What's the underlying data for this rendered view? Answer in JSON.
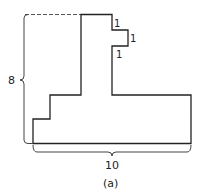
{
  "figure": {
    "caption": "(a)",
    "colors": {
      "stroke": "#222222",
      "background": "#ffffff",
      "dashed": "#555555"
    },
    "dimensions": {
      "height_label": "8",
      "width_label": "10",
      "notch_labels": [
        "1",
        "1",
        "1"
      ]
    },
    "shape": {
      "description": "Rectilinear polygon: tall narrow stem with a 1x1 notch protrusion on the right near the top, wide base extending right, stepped lower-left corner"
    }
  }
}
